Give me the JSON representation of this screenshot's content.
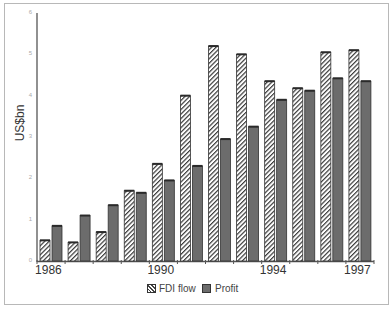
{
  "chart_data": {
    "type": "bar",
    "title": "",
    "xlabel": "",
    "ylabel": "US$bn",
    "ylim": [
      0,
      6
    ],
    "yticks": [
      0,
      1,
      2,
      3,
      4,
      5,
      6
    ],
    "categories": [
      "1986",
      "1987",
      "1988",
      "1989",
      "1990",
      "1991",
      "1992",
      "1993",
      "1994",
      "1995",
      "1996",
      "1997"
    ],
    "xtick_labels_shown": [
      "1986",
      "1990",
      "1994",
      "1997"
    ],
    "series": [
      {
        "name": "FDI flow",
        "style": "hatched",
        "values": [
          0.5,
          0.45,
          0.7,
          1.7,
          2.35,
          4.0,
          5.2,
          5.0,
          4.35,
          4.18,
          5.05,
          5.1
        ]
      },
      {
        "name": "Profit",
        "style": "solid-grey",
        "color": "#6c6c6c",
        "values": [
          0.85,
          1.1,
          1.35,
          1.65,
          1.95,
          2.3,
          2.95,
          3.25,
          3.9,
          4.12,
          4.42,
          4.35
        ]
      }
    ],
    "legend_position": "bottom",
    "grid": false
  },
  "axis": {
    "ylabel": "US$bn"
  },
  "legend": {
    "items": [
      {
        "label": "FDI flow"
      },
      {
        "label": "Profit"
      }
    ]
  }
}
